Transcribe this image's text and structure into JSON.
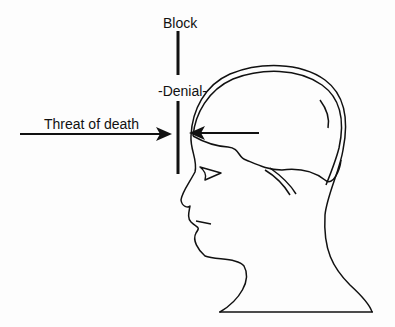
{
  "diagram": {
    "labels": {
      "block": "Block",
      "denial": "-Denial-",
      "threat": "Threat of death"
    },
    "elements": {
      "left_arrow": "arrow pointing right toward barrier",
      "right_arrow": "arrow pointing left from head toward barrier",
      "barrier": "vertical block line",
      "head": "profile head with brain outline"
    },
    "colors": {
      "line": "#111111",
      "background": "#fdfdfd"
    }
  }
}
